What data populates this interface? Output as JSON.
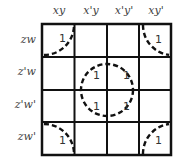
{
  "diagram": {
    "type": "karnaugh-map",
    "column_headers": [
      "xy",
      "x'y",
      "x'y'",
      "xy'"
    ],
    "row_headers": [
      "zw",
      "z'w",
      "z'w'",
      "zw'"
    ],
    "cells": [
      [
        "1",
        "",
        "",
        "1"
      ],
      [
        "",
        "1",
        "1",
        ""
      ],
      [
        "",
        "1",
        "1",
        ""
      ],
      [
        "1",
        "",
        "",
        "1"
      ]
    ],
    "groups": [
      {
        "name": "corners",
        "cells": [
          [
            0,
            0
          ],
          [
            0,
            3
          ],
          [
            3,
            0
          ],
          [
            3,
            3
          ]
        ]
      },
      {
        "name": "center",
        "cells": [
          [
            1,
            1
          ],
          [
            1,
            2
          ],
          [
            2,
            1
          ],
          [
            2,
            2
          ]
        ]
      }
    ]
  }
}
